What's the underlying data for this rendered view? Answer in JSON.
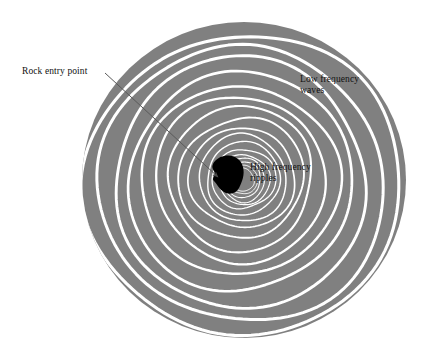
{
  "figure": {
    "background_color": "#ffffff",
    "pond_color": "#808080",
    "wave_color": "#ffffff",
    "rock_color": "#000000",
    "leader_color": "#555555",
    "text_color": "#111111"
  },
  "labels": {
    "rock_entry": "Rock entry point",
    "low_frequency": "Low frequency\nwaves",
    "high_frequency": "High frequency\nripples"
  },
  "chart_data": {
    "type": "diagram",
    "pond": {
      "center_x": 244,
      "center_y": 180,
      "radius_x": 162,
      "radius_y": 158,
      "fill": "#808080"
    },
    "rock": {
      "center_x": 227,
      "center_y": 174,
      "width": 31,
      "height": 36,
      "fill": "#000000"
    },
    "leader_line": {
      "from_x": 105,
      "from_y": 73,
      "to_x": 220,
      "to_y": 179,
      "arrow": "arrowhead-at-end"
    },
    "rings": {
      "count": 17,
      "stroke": "#ffffff",
      "inner_spacing_px": 3,
      "outer_spacing_px": 21,
      "radii": [
        12,
        15,
        18,
        22,
        26,
        31,
        37,
        44,
        52,
        62,
        73,
        85,
        98,
        112,
        127,
        142,
        156
      ],
      "stroke_widths": [
        1.0,
        1.0,
        1.1,
        1.1,
        1.2,
        1.3,
        1.4,
        1.5,
        1.7,
        1.9,
        2.1,
        2.3,
        2.5,
        2.7,
        2.9,
        3.0,
        3.1
      ]
    },
    "annotations": [
      {
        "text": "Rock entry point",
        "x": 22,
        "y": 66,
        "points_to": "rock"
      },
      {
        "text": "Low frequency waves",
        "x": 300,
        "y": 74,
        "points_to": "outer-rings"
      },
      {
        "text": "High frequency ripples",
        "x": 250,
        "y": 162,
        "points_to": "inner-rings"
      }
    ]
  }
}
